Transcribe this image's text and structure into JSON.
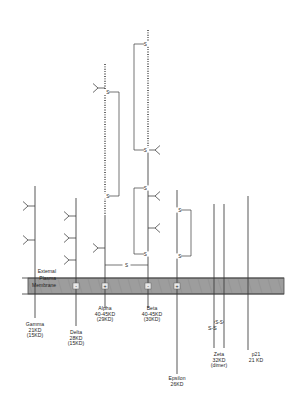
{
  "diagram": {
    "membrane": {
      "external_label": "External",
      "plasma_label": "Plasma",
      "membrane_label": "Membrane",
      "band_color": "#9d9d9d",
      "band_top_y": 278,
      "band_height": 16
    },
    "colors": {
      "line": "#3a3a3a",
      "membrane_fill": "#9d9d9d",
      "membrane_edge": "#4a4a4a",
      "text": "#1c1c1c"
    },
    "annotations": [
      {
        "name": "ss-bond-right",
        "text": "S-S",
        "x": 208,
        "y": 325
      }
    ],
    "chains": [
      {
        "id": "gamma",
        "name": "Gamma",
        "label": "Gamma\n21KD\n(15KD)",
        "mass": "21KD",
        "mass_alt": "(15KD)",
        "x": 35,
        "top_y": 186,
        "bottom_y": 318,
        "label_x": 35,
        "label_y": 322,
        "glycans": [
          {
            "y": 206,
            "dir": "left"
          },
          {
            "y": 240,
            "dir": "left"
          }
        ]
      },
      {
        "id": "delta",
        "name": "Delta",
        "label": "Delta\n28KD\n(15KD)",
        "mass": "28KD",
        "mass_alt": "(15KD)",
        "x": 76,
        "top_y": 198,
        "bottom_y": 326,
        "label_x": 76,
        "label_y": 330,
        "glycans": [
          {
            "y": 216,
            "dir": "left"
          },
          {
            "y": 238,
            "dir": "left"
          },
          {
            "y": 260,
            "dir": "left"
          }
        ]
      },
      {
        "id": "alpha",
        "name": "Alpha",
        "label": "Alpha\n40-45KD\n(29KD)",
        "mass": "40-45KD",
        "mass_alt": "(29KD)",
        "x": 105,
        "top_y": 64,
        "bottom_y": 308,
        "label_x": 105,
        "label_y": 306,
        "dotted_from": 64,
        "dotted_to": 215,
        "glycans": [
          {
            "y": 88,
            "dir": "left"
          },
          {
            "y": 248,
            "dir": "left"
          }
        ]
      },
      {
        "id": "beta",
        "name": "Beta",
        "label": "Beta\n40-45KD\n(30KD)",
        "mass": "40-45KD",
        "mass_alt": "(30KD)",
        "x": 148,
        "top_y": 30,
        "bottom_y": 308,
        "label_x": 152,
        "label_y": 306,
        "dotted_from": 30,
        "dotted_to": 150,
        "glycans": [
          {
            "y": 150,
            "dir": "right"
          },
          {
            "y": 196,
            "dir": "right"
          },
          {
            "y": 228,
            "dir": "right"
          }
        ]
      },
      {
        "id": "epsilon",
        "name": "Epsilon",
        "label": "Epsilon\n26KD",
        "mass": "26KD",
        "mass_alt": "",
        "x": 177,
        "top_y": 190,
        "bottom_y": 374,
        "label_x": 177,
        "label_y": 376,
        "glycans": []
      },
      {
        "id": "zeta",
        "name": "Zeta",
        "label": "Zeta\n32KD\n(dimer)",
        "mass": "32KD",
        "mass_alt": "(dimer)",
        "x": 214,
        "top_y": 204,
        "bottom_y": 348,
        "label_x": 219,
        "label_y": 352,
        "glycans": []
      },
      {
        "id": "zeta-partner",
        "name": "Zeta partner",
        "label": "",
        "mass": "",
        "mass_alt": "",
        "x": 224,
        "top_y": 204,
        "bottom_y": 348,
        "label_x": 0,
        "label_y": 0,
        "glycans": []
      },
      {
        "id": "p21",
        "name": "p21",
        "label": "p21\n21 KD",
        "mass": "21 KD",
        "mass_alt": "",
        "x": 248,
        "top_y": 196,
        "bottom_y": 350,
        "label_x": 256,
        "label_y": 352,
        "glycans": []
      }
    ],
    "disulfides": [
      {
        "id": "alpha-internal-upper",
        "label": "S",
        "x1": 105,
        "y1": 92,
        "x2": 105,
        "y2": 196,
        "side": "right",
        "depth": 14
      },
      {
        "id": "beta-internal-upper",
        "label": "S",
        "x1": 148,
        "y1": 44,
        "x2": 148,
        "y2": 150,
        "side": "left",
        "depth": 14
      },
      {
        "id": "beta-internal-lower",
        "label": "S",
        "x1": 148,
        "y1": 188,
        "x2": 148,
        "y2": 254,
        "side": "left",
        "depth": 14
      },
      {
        "id": "epsilon-internal",
        "label": "S",
        "x1": 177,
        "y1": 210,
        "x2": 177,
        "y2": 256,
        "side": "right",
        "depth": 14
      },
      {
        "id": "alpha-beta-bridge",
        "label": "S",
        "x1": 105,
        "y1": 265,
        "x2": 148,
        "y2": 265,
        "side": "horizontal",
        "depth": 0
      },
      {
        "id": "zeta-dimer-bridge",
        "label": "S-S",
        "x1": 214,
        "y1": 322,
        "x2": 224,
        "y2": 322,
        "side": "horizontal",
        "depth": 0
      }
    ],
    "membrane_charges": [
      {
        "symbol": "-",
        "x": 76
      },
      {
        "symbol": "+",
        "x": 105
      },
      {
        "symbol": "-",
        "x": 148
      },
      {
        "symbol": "+",
        "x": 177
      }
    ]
  }
}
